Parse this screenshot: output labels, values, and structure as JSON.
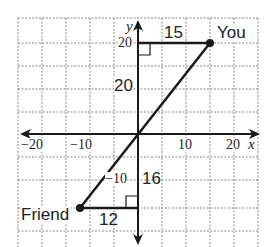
{
  "diagram": {
    "type": "coordinate-plane",
    "origin_px": [
      138,
      134
    ],
    "grid": {
      "color": "#8a8a8a",
      "style": "dashed",
      "cols_px": [
        18,
        42,
        66,
        90,
        114,
        138,
        162,
        186,
        210,
        234,
        258
      ],
      "rows_px": [
        18,
        43,
        66,
        89,
        112,
        134,
        157,
        180,
        208,
        231
      ]
    },
    "axes": {
      "x_label": "x",
      "y_label": "y",
      "x_ticks": [
        {
          "label": "−20",
          "value": -20
        },
        {
          "label": "−10",
          "value": -10
        },
        {
          "label": "10",
          "value": 10
        },
        {
          "label": "20",
          "value": 20
        }
      ],
      "y_ticks": [
        {
          "label": "20",
          "value": 20
        },
        {
          "label": "−10",
          "value": -10
        }
      ]
    },
    "points": [
      {
        "name": "You",
        "label": "You",
        "x": 15,
        "y": 20
      },
      {
        "name": "Friend",
        "label": "Friend",
        "x": -12,
        "y": -16
      }
    ],
    "segment_labels": {
      "you_horizontal": "15",
      "you_vertical": "20",
      "friend_vertical": "16",
      "friend_horizontal": "12"
    },
    "colors": {
      "ink": "#1a1a1a",
      "grid": "#8a8a8a",
      "background": "#ffffff"
    }
  }
}
